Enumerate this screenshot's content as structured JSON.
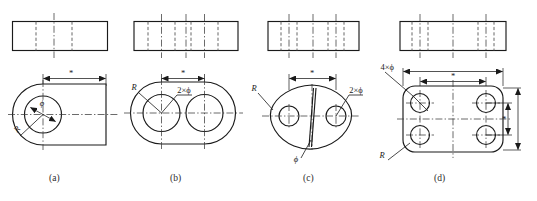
{
  "figure": {
    "title": "",
    "background_color": "#ffffff",
    "line_color": "#1a1a1a",
    "panel_count": 4
  },
  "symbols": {
    "asterisk": "*",
    "phi": "ϕ",
    "radius": "R",
    "two_times_phi": "2×ϕ",
    "four_times_phi": "4×ϕ"
  },
  "panels": [
    {
      "id": "a",
      "caption": "(a)",
      "shape_name": "d-shaped-plate",
      "front_view": {
        "type": "rectangle-with-hidden-lines",
        "hidden_line_count": 2,
        "centerline_count": 1
      },
      "top_view": {
        "type": "single-hole-plate",
        "hole_count": 1
      },
      "labels": [
        {
          "name": "width-dimension",
          "text": "*"
        },
        {
          "name": "hole-diameter",
          "text": "ϕ"
        },
        {
          "name": "corner-radius",
          "text": "R"
        }
      ]
    },
    {
      "id": "b",
      "caption": "(b)",
      "shape_name": "obround-two-hole-plate",
      "front_view": {
        "type": "rectangle-with-hidden-lines",
        "hidden_line_count": 4,
        "centerline_count": 3
      },
      "top_view": {
        "type": "stadium-two-hole-plate",
        "hole_count": 2
      },
      "labels": [
        {
          "name": "hole-spacing-dimension",
          "text": "*"
        },
        {
          "name": "hole-diameter",
          "text": "2×ϕ"
        },
        {
          "name": "end-radius",
          "text": "R"
        }
      ]
    },
    {
      "id": "c",
      "caption": "(c)",
      "shape_name": "lens-shaped-plate",
      "front_view": {
        "type": "rectangle-with-hidden-lines",
        "hidden_line_count": 4,
        "centerline_count": 3
      },
      "top_view": {
        "type": "lens-plate-two-holes-and-slot",
        "hole_count": 2
      },
      "labels": [
        {
          "name": "hole-spacing-dimension",
          "text": "*"
        },
        {
          "name": "side-hole-diameter",
          "text": "2×ϕ"
        },
        {
          "name": "slot-diameter",
          "text": "ϕ"
        },
        {
          "name": "end-radius",
          "text": "R"
        }
      ]
    },
    {
      "id": "d",
      "caption": "(d)",
      "shape_name": "rounded-rectangle-four-hole-plate",
      "front_view": {
        "type": "rectangle-with-hidden-lines",
        "hidden_line_count": 4,
        "centerline_count": 3
      },
      "top_view": {
        "type": "rounded-rect-four-hole-plate",
        "hole_count": 4
      },
      "labels": [
        {
          "name": "horizontal-hole-spacing",
          "text": "*"
        },
        {
          "name": "vertical-hole-spacing",
          "text": "*"
        },
        {
          "name": "hole-diameter",
          "text": "4×ϕ"
        },
        {
          "name": "corner-radius",
          "text": "R"
        }
      ]
    }
  ],
  "captions": {
    "a": "(a)",
    "b": "(b)",
    "c": "(c)",
    "d": "(d)"
  }
}
